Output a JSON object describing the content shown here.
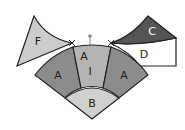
{
  "diagram": {
    "pieces": [
      {
        "id": "F",
        "label": "F",
        "fill": "#cccccc",
        "text_color": "#222222"
      },
      {
        "id": "C",
        "label": "C",
        "fill": "#555555",
        "text_color": "#ffffff"
      },
      {
        "id": "D",
        "label": "D",
        "fill": "#ffffff",
        "text_color": "#222222"
      },
      {
        "id": "A-left",
        "label": "A",
        "fill": "#8c8c8c",
        "text_color": "#222222"
      },
      {
        "id": "A-center",
        "label": "A",
        "fill": "#b4b4b4",
        "text_color": "#222222"
      },
      {
        "id": "A-right",
        "label": "A",
        "fill": "#8c8c8c",
        "text_color": "#222222"
      },
      {
        "id": "B",
        "label": "B",
        "fill": "#d0d0d0",
        "text_color": "#222222"
      }
    ],
    "center_mark_label": "I",
    "outline_color": "#222222",
    "pin_color": "#888888"
  }
}
